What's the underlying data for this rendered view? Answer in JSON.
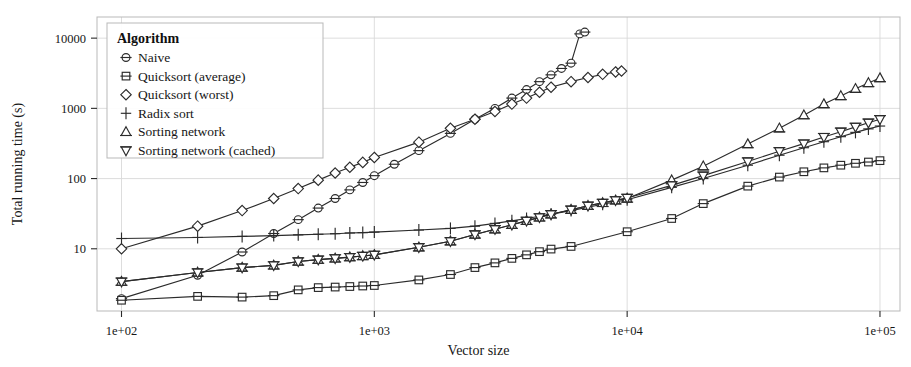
{
  "chart_data": {
    "type": "line",
    "title": "",
    "xlabel": "Vector size",
    "ylabel": "Total running time (s)",
    "xscale": "log",
    "yscale": "log",
    "xlim": [
      80,
      120000
    ],
    "ylim": [
      1.3,
      20000
    ],
    "grid": true,
    "legend_position": "top-left",
    "legend_title": "Algorithm",
    "x_ticks": [
      {
        "value": 100,
        "label": "1e+02"
      },
      {
        "value": 1000,
        "label": "1e+03"
      },
      {
        "value": 10000,
        "label": "1e+04"
      },
      {
        "value": 100000,
        "label": "1e+05"
      }
    ],
    "y_ticks": [
      {
        "value": 10,
        "label": "10"
      },
      {
        "value": 100,
        "label": "100"
      },
      {
        "value": 1000,
        "label": "1000"
      },
      {
        "value": 10000,
        "label": "10000"
      }
    ],
    "series": [
      {
        "name": "Naive",
        "marker": "circle-hbar",
        "points": [
          [
            100,
            1.95
          ],
          [
            200,
            4.2
          ],
          [
            300,
            9.0
          ],
          [
            400,
            16.5
          ],
          [
            500,
            26
          ],
          [
            600,
            38
          ],
          [
            700,
            52
          ],
          [
            800,
            69
          ],
          [
            900,
            88
          ],
          [
            1000,
            110
          ],
          [
            1200,
            160
          ],
          [
            1500,
            250
          ],
          [
            2000,
            440
          ],
          [
            2500,
            700
          ],
          [
            3000,
            1000
          ],
          [
            3500,
            1400
          ],
          [
            4000,
            1850
          ],
          [
            4500,
            2400
          ],
          [
            5000,
            3000
          ],
          [
            5500,
            3700
          ],
          [
            6000,
            4400
          ],
          [
            6500,
            11500
          ],
          [
            6800,
            12200
          ]
        ]
      },
      {
        "name": "Quicksort (average)",
        "marker": "square-hbar",
        "points": [
          [
            100,
            1.85
          ],
          [
            200,
            2.1
          ],
          [
            300,
            2.05
          ],
          [
            400,
            2.15
          ],
          [
            500,
            2.6
          ],
          [
            600,
            2.8
          ],
          [
            700,
            2.85
          ],
          [
            800,
            2.9
          ],
          [
            900,
            2.95
          ],
          [
            1000,
            3.0
          ],
          [
            1500,
            3.6
          ],
          [
            2000,
            4.3
          ],
          [
            2500,
            5.4
          ],
          [
            3000,
            6.3
          ],
          [
            3500,
            7.3
          ],
          [
            4000,
            8.2
          ],
          [
            4500,
            9.1
          ],
          [
            5000,
            9.9
          ],
          [
            6000,
            10.8
          ],
          [
            10000,
            17.5
          ],
          [
            15000,
            27
          ],
          [
            20000,
            44
          ],
          [
            30000,
            78
          ],
          [
            40000,
            105
          ],
          [
            50000,
            125
          ],
          [
            60000,
            142
          ],
          [
            70000,
            155
          ],
          [
            80000,
            165
          ],
          [
            90000,
            172
          ],
          [
            100000,
            180
          ]
        ]
      },
      {
        "name": "Quicksort (worst)",
        "marker": "diamond",
        "points": [
          [
            100,
            10.0
          ],
          [
            200,
            21
          ],
          [
            300,
            35
          ],
          [
            400,
            52
          ],
          [
            500,
            72
          ],
          [
            600,
            95
          ],
          [
            700,
            120
          ],
          [
            800,
            145
          ],
          [
            900,
            170
          ],
          [
            1000,
            200
          ],
          [
            1500,
            330
          ],
          [
            2000,
            520
          ],
          [
            2500,
            700
          ],
          [
            3000,
            900
          ],
          [
            3500,
            1150
          ],
          [
            4000,
            1400
          ],
          [
            4500,
            1700
          ],
          [
            5000,
            2000
          ],
          [
            6000,
            2400
          ],
          [
            7000,
            2750
          ],
          [
            8000,
            3050
          ],
          [
            9000,
            3300
          ],
          [
            9500,
            3400
          ]
        ]
      },
      {
        "name": "Radix sort",
        "marker": "plus",
        "points": [
          [
            100,
            14.0
          ],
          [
            200,
            14.5
          ],
          [
            300,
            15.0
          ],
          [
            400,
            15.4
          ],
          [
            500,
            15.8
          ],
          [
            600,
            16.1
          ],
          [
            700,
            16.4
          ],
          [
            800,
            16.8
          ],
          [
            900,
            17.0
          ],
          [
            1000,
            17.3
          ],
          [
            1500,
            18.5
          ],
          [
            2000,
            19.5
          ],
          [
            2500,
            21
          ],
          [
            3000,
            23
          ],
          [
            3500,
            25
          ],
          [
            4000,
            27
          ],
          [
            5000,
            31
          ],
          [
            6000,
            35
          ],
          [
            8000,
            43
          ],
          [
            10000,
            50
          ],
          [
            15000,
            75
          ],
          [
            20000,
            100
          ],
          [
            30000,
            155
          ],
          [
            40000,
            215
          ],
          [
            50000,
            275
          ],
          [
            60000,
            335
          ],
          [
            70000,
            395
          ],
          [
            80000,
            455
          ],
          [
            90000,
            510
          ],
          [
            100000,
            560
          ]
        ]
      },
      {
        "name": "Sorting network",
        "marker": "triangle-up-hbar",
        "points": [
          [
            100,
            3.4
          ],
          [
            200,
            4.6
          ],
          [
            300,
            5.4
          ],
          [
            400,
            5.8
          ],
          [
            500,
            6.6
          ],
          [
            600,
            7.0
          ],
          [
            700,
            7.3
          ],
          [
            800,
            7.6
          ],
          [
            900,
            7.9
          ],
          [
            1000,
            8.2
          ],
          [
            1500,
            10.5
          ],
          [
            2000,
            12.8
          ],
          [
            2500,
            16
          ],
          [
            3000,
            19
          ],
          [
            3500,
            22
          ],
          [
            4000,
            25
          ],
          [
            4500,
            28
          ],
          [
            5000,
            31
          ],
          [
            6000,
            36
          ],
          [
            7000,
            41
          ],
          [
            8000,
            45
          ],
          [
            9000,
            49
          ],
          [
            10000,
            52
          ],
          [
            15000,
            95
          ],
          [
            20000,
            150
          ],
          [
            30000,
            310
          ],
          [
            40000,
            520
          ],
          [
            50000,
            800
          ],
          [
            60000,
            1150
          ],
          [
            70000,
            1500
          ],
          [
            80000,
            1900
          ],
          [
            90000,
            2300
          ],
          [
            100000,
            2700
          ]
        ]
      },
      {
        "name": "Sorting network (cached)",
        "marker": "triangle-down",
        "points": [
          [
            100,
            3.4
          ],
          [
            200,
            4.6
          ],
          [
            300,
            5.4
          ],
          [
            400,
            5.8
          ],
          [
            500,
            6.6
          ],
          [
            600,
            7.0
          ],
          [
            700,
            7.3
          ],
          [
            800,
            7.6
          ],
          [
            900,
            7.9
          ],
          [
            1000,
            8.2
          ],
          [
            1500,
            10.5
          ],
          [
            2000,
            12.8
          ],
          [
            2500,
            16
          ],
          [
            3000,
            19
          ],
          [
            3500,
            22
          ],
          [
            4000,
            25
          ],
          [
            4500,
            28
          ],
          [
            5000,
            31
          ],
          [
            6000,
            36
          ],
          [
            7000,
            41
          ],
          [
            8000,
            45
          ],
          [
            9000,
            49
          ],
          [
            10000,
            53
          ],
          [
            15000,
            80
          ],
          [
            20000,
            110
          ],
          [
            30000,
            175
          ],
          [
            40000,
            245
          ],
          [
            50000,
            315
          ],
          [
            60000,
            390
          ],
          [
            70000,
            465
          ],
          [
            80000,
            545
          ],
          [
            90000,
            625
          ],
          [
            100000,
            700
          ]
        ]
      }
    ]
  },
  "legend": {
    "title": "Algorithm",
    "items": [
      {
        "label": "Naive",
        "marker": "circle-hbar"
      },
      {
        "label": "Quicksort (average)",
        "marker": "square-hbar"
      },
      {
        "label": "Quicksort (worst)",
        "marker": "diamond"
      },
      {
        "label": "Radix sort",
        "marker": "plus"
      },
      {
        "label": "Sorting network",
        "marker": "triangle-up-hbar"
      },
      {
        "label": "Sorting network (cached)",
        "marker": "triangle-down"
      }
    ]
  },
  "colors": {
    "ink": "#2b2b2b",
    "grid": "#d9d9d9",
    "border": "#b9b9b9",
    "background": "#ffffff"
  }
}
